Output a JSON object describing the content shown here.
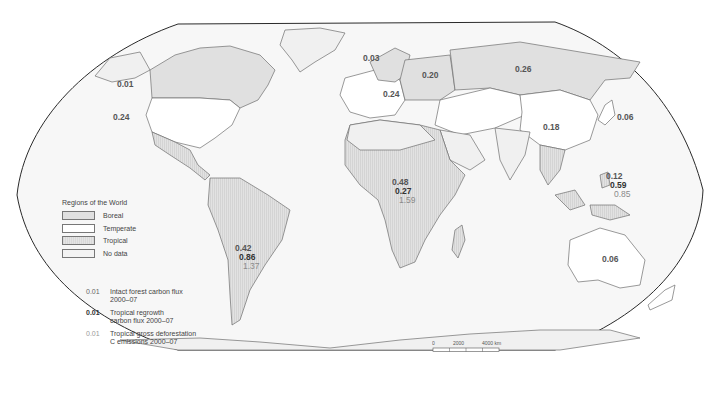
{
  "map": {
    "projection": "Robinson",
    "legend": {
      "title": "Regions of the World",
      "items": [
        {
          "key": "boreal",
          "label": "Boreal"
        },
        {
          "key": "temperate",
          "label": "Temperate"
        },
        {
          "key": "tropical",
          "label": "Tropical"
        },
        {
          "key": "nodata",
          "label": "No data"
        }
      ]
    },
    "flux_key": [
      {
        "key": "intact",
        "value": "0.01",
        "label_line1": "Intact forest carbon flux",
        "label_line2": "2000–07"
      },
      {
        "key": "regrowth",
        "value": "0.01",
        "label_line1": "Tropical regrowth",
        "label_line2": "carbon flux 2000–07"
      },
      {
        "key": "defor",
        "value": "0.01",
        "label_line1": "Tropical gross deforestation",
        "label_line2": "C emissions 2000–07"
      }
    ],
    "regions": [
      {
        "name": "Canada",
        "type": "boreal",
        "intact": "0.01"
      },
      {
        "name": "USA",
        "type": "temperate",
        "intact": "0.24"
      },
      {
        "name": "Scandinavia",
        "type": "boreal",
        "intact": "0.03"
      },
      {
        "name": "European Russia",
        "type": "boreal",
        "intact": "0.20"
      },
      {
        "name": "Europe",
        "type": "temperate",
        "intact": "0.24"
      },
      {
        "name": "Asian Russia",
        "type": "boreal",
        "intact": "0.26"
      },
      {
        "name": "China",
        "type": "temperate",
        "intact": "0.18"
      },
      {
        "name": "Japan",
        "type": "temperate",
        "intact": "0.06"
      },
      {
        "name": "Tropical America",
        "type": "tropical",
        "intact": "0.42",
        "regrowth": "0.86",
        "defor": "1.37"
      },
      {
        "name": "Tropical Africa",
        "type": "tropical",
        "intact": "0.48",
        "regrowth": "0.27",
        "defor": "1.59"
      },
      {
        "name": "Tropical Asia",
        "type": "tropical",
        "intact": "0.12",
        "regrowth": "0.59",
        "defor": "0.85"
      },
      {
        "name": "Australia",
        "type": "temperate",
        "intact": "0.06"
      }
    ],
    "scale_bar": {
      "ticks": [
        "0",
        "2000",
        "4000 km"
      ]
    },
    "colors": {
      "boreal": "#e0e0e0",
      "temperate": "#ffffff",
      "tropical": "#dcdcdc",
      "nodata": "#f0f0f0",
      "border": "#333333"
    }
  }
}
